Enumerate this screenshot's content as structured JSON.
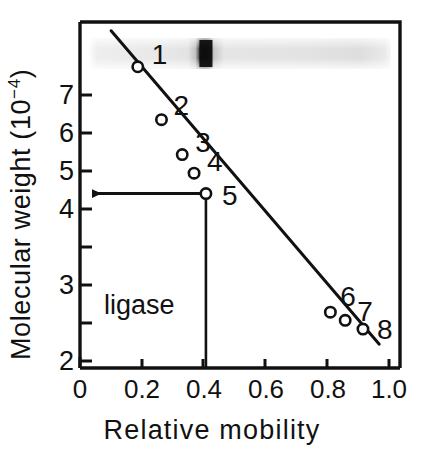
{
  "chart_data": {
    "type": "scatter",
    "title": "",
    "subtitle": "",
    "xlabel": "Relative mobility",
    "ylabel": "Molecular weight (10⁻⁴)",
    "ylabel_base": "Molecular weight (10",
    "ylabel_exp": "−4",
    "ylabel_tail": ")",
    "xlim": [
      0,
      1.08
    ],
    "ylim": [
      1.6,
      7.55
    ],
    "grid": false,
    "legend": "none",
    "x_ticks": [
      0,
      0.2,
      0.4,
      0.6,
      0.8,
      1.0
    ],
    "x_tick_labels": [
      "0",
      "0.2",
      "0.4",
      "0.6",
      "0.8",
      "1.0"
    ],
    "y_ticks": [
      2,
      3,
      4,
      5,
      6,
      7
    ],
    "y_tick_labels": [
      "2",
      "3",
      "4",
      "5",
      "6",
      "7"
    ],
    "series": [
      {
        "name": "Molecular weight standards",
        "marker": "open-circle",
        "points": [
          {
            "label": "1",
            "x": 0.195,
            "y": 6.78
          },
          {
            "label": "2",
            "x": 0.275,
            "y": 5.87
          },
          {
            "label": "3",
            "x": 0.345,
            "y": 5.27
          },
          {
            "label": "4",
            "x": 0.385,
            "y": 4.95
          },
          {
            "label": "5",
            "x": 0.425,
            "y": 4.6
          },
          {
            "label": "6",
            "x": 0.845,
            "y": 2.56
          },
          {
            "label": "7",
            "x": 0.895,
            "y": 2.42
          },
          {
            "label": "8",
            "x": 0.955,
            "y": 2.27
          }
        ]
      }
    ],
    "fit_line": {
      "name": "calibration line",
      "x_start": 0.105,
      "y_start": 7.4,
      "x_end": 1.01,
      "y_end": 2.01
    },
    "annotations": [
      {
        "name": "ligase",
        "label": "ligase",
        "arrow_from_x": 0.425,
        "arrow_to_x": 0.0,
        "arrow_y": 4.6,
        "dropline_x": 0.425,
        "dropline_y_top": 4.6,
        "dropline_y_bottom": 1.6,
        "read_out_value": 4.6
      }
    ],
    "gel_lane": {
      "name": "electrophoresis gel lane",
      "x_start": 0.09,
      "x_end": 1.03,
      "band_center": 0.425,
      "band_label": "ligase band"
    }
  },
  "colors": {
    "axis": "#111111",
    "line": "#111111",
    "marker_stroke": "#111111",
    "marker_fill": "#ffffff",
    "band": "#111111",
    "gel_background": "#e8e8e8",
    "background": "#ffffff"
  }
}
